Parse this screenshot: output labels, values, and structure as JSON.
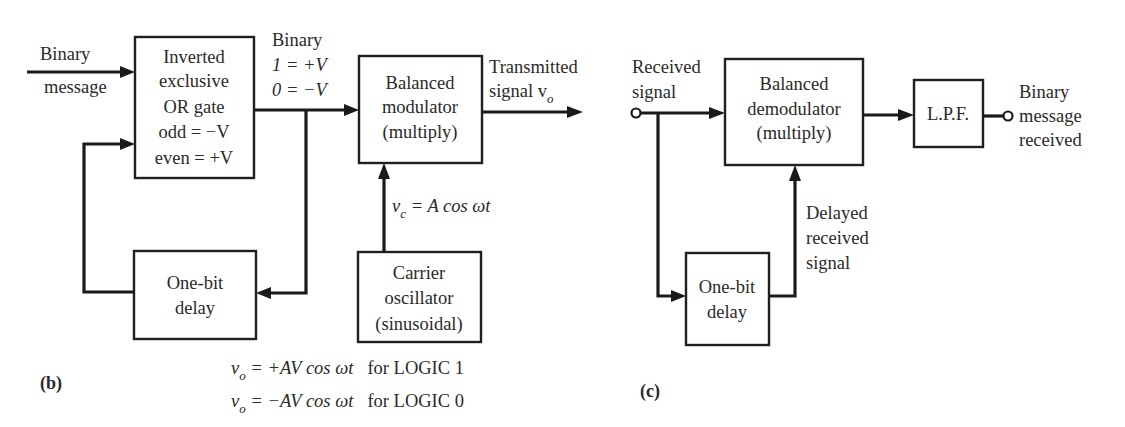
{
  "panels": {
    "b": {
      "label": "(b)",
      "input_label": [
        "Binary",
        "message"
      ],
      "xor_box": [
        "Inverted",
        "exclusive",
        "OR gate",
        "odd = −V",
        "even = +V"
      ],
      "binary_levels": [
        "Binary",
        "1 = +V",
        "0 = −V"
      ],
      "modulator_box": [
        "Balanced",
        "modulator",
        "(multiply)"
      ],
      "output_label": [
        "Transmitted",
        "signal v",
        "o"
      ],
      "carrier_label": {
        "v": "v",
        "sub": "c",
        "rest": " = A  cos ωt"
      },
      "carrier_box": [
        "Carrier",
        "oscillator",
        "(sinusoidal)"
      ],
      "delay_box": [
        "One-bit",
        "delay"
      ],
      "equations": [
        {
          "v": "v",
          "sub": "o",
          "rhs": " = +AV cos ωt",
          "cond": "for LOGIC 1"
        },
        {
          "v": "v",
          "sub": "o",
          "rhs": " = −AV cos ωt",
          "cond": "for LOGIC 0"
        }
      ]
    },
    "c": {
      "label": "(c)",
      "input_label": [
        "Received",
        "signal"
      ],
      "demodulator_box": [
        "Balanced",
        "demodulator",
        "(multiply)"
      ],
      "lpf_box": "L.P.F.",
      "output_label": [
        "Binary",
        "message",
        "received"
      ],
      "delayed_label": [
        "Delayed",
        "received",
        "signal"
      ],
      "delay_box": [
        "One-bit",
        "delay"
      ]
    }
  },
  "colors": {
    "line": "#1a1a1a",
    "text": "#2a2a2a",
    "background": "#ffffff"
  }
}
